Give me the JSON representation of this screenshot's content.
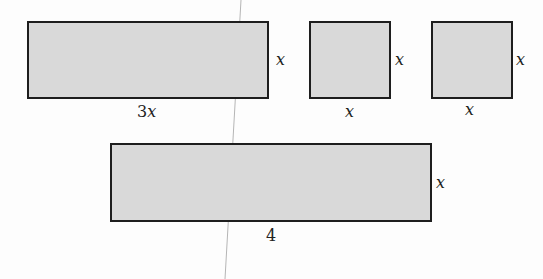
{
  "figure": {
    "shapes": [
      {
        "id": "rect-3x-by-x",
        "width_label": "3x",
        "height_label": "x"
      },
      {
        "id": "square-1",
        "width_label": "x",
        "height_label": "x"
      },
      {
        "id": "square-2",
        "width_label": "x",
        "height_label": "x"
      },
      {
        "id": "rect-4-by-x",
        "width_label": "4",
        "height_label": "x"
      }
    ],
    "colors": {
      "fill": "#d9d9d9",
      "stroke": "#1e1e1e",
      "fold_line": "#b5b5b5"
    }
  }
}
